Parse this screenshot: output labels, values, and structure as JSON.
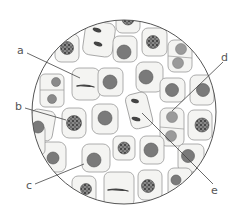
{
  "diagram": {
    "type": "microscope-field-cell-division",
    "colors": {
      "background": "#ffffff",
      "field_outline": "#555555",
      "cell_fill": "#f4f4f2",
      "cell_stroke": "#999999",
      "nucleus_fill": "#7a7a7a",
      "nucleus_stroke": "#555555",
      "daughter_nucleus_fill": "#9a9a9a",
      "chromosome": "#333333",
      "leader_line": "#444444"
    },
    "labels": [
      {
        "id": "a",
        "text": "a"
      },
      {
        "id": "b",
        "text": "b"
      },
      {
        "id": "c",
        "text": "c"
      },
      {
        "id": "d",
        "text": "d"
      },
      {
        "id": "e",
        "text": "e"
      }
    ]
  }
}
